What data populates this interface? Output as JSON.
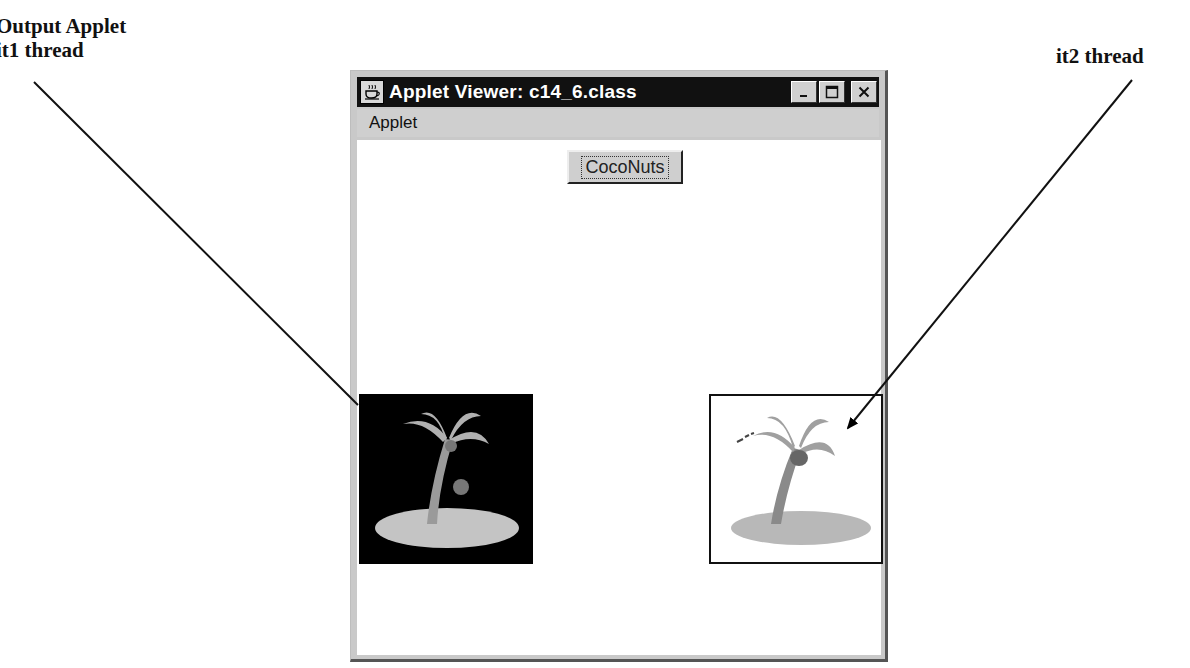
{
  "annotations": {
    "left_label_line1": "Output Applet",
    "left_label_line2": "it1 thread",
    "right_label": "it2 thread"
  },
  "window": {
    "title": "Applet Viewer: c14_6.class",
    "icon": "java-cup-icon",
    "controls": {
      "minimize": "_",
      "maximize": "□",
      "close": "✕"
    },
    "menu": [
      {
        "label": "Applet"
      }
    ],
    "applet": {
      "button_label": "CocoNuts",
      "images": [
        {
          "thread": "it1",
          "background": "#000000",
          "subject": "palm-tree-island"
        },
        {
          "thread": "it2",
          "background": "#ffffff",
          "subject": "palm-tree-island"
        }
      ]
    }
  }
}
